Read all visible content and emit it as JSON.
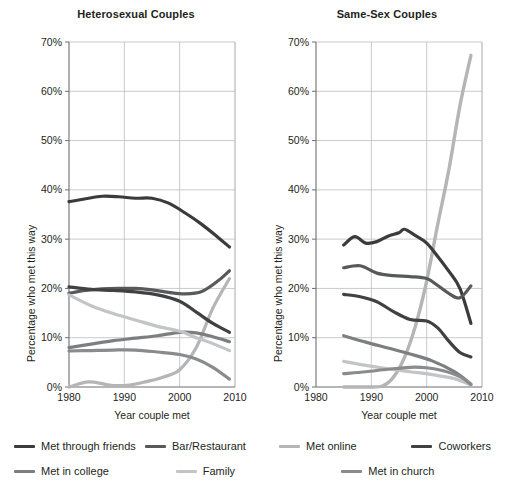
{
  "figure": {
    "xlabel": "Year couple met",
    "ylabel": "Percentage who met this way"
  },
  "legend": {
    "rows": [
      [
        {
          "label": "Met through friends",
          "color": "#3b3b3b",
          "key": "met_through_friends"
        },
        {
          "label": "Bar/Restaurant",
          "color": "#58595b",
          "key": "bar_restaurant"
        },
        {
          "label": "Met online",
          "color": "#b5b5b5",
          "key": "met_online"
        },
        {
          "label": "Coworkers",
          "color": "#414141",
          "key": "coworkers"
        }
      ],
      [
        {
          "label": "Met in college",
          "color": "#7d7e80",
          "key": "met_in_college"
        },
        {
          "label": "Family",
          "color": "#c3c4c6",
          "key": "family"
        },
        {
          "label": "Met in church",
          "color": "#8a8b8d",
          "key": "met_in_church"
        }
      ]
    ]
  },
  "chart_data": [
    {
      "type": "line",
      "title": "Heterosexual Couples",
      "xlabel": "Year couple met",
      "ylabel": "Percentage who met this way",
      "xlim": [
        1980,
        2010
      ],
      "ylim": [
        0,
        70
      ],
      "xticks": [
        1980,
        1990,
        2000,
        2010
      ],
      "yticks": [
        0,
        10,
        20,
        30,
        40,
        50,
        60,
        70
      ],
      "ytick_labels": [
        "0%",
        "10%",
        "20%",
        "30%",
        "40%",
        "50%",
        "60%",
        "70%"
      ],
      "grid": true,
      "legend_position": "below-figure",
      "series": [
        {
          "name": "Met through friends",
          "color": "#3b3b3b",
          "width": 3.2,
          "x": [
            1980,
            1983,
            1986,
            1989,
            1992,
            1995,
            1998,
            2001,
            2004,
            2007,
            2009
          ],
          "values": [
            37.6,
            38.2,
            38.7,
            38.6,
            38.3,
            38.3,
            37.3,
            35.3,
            33.0,
            30.3,
            28.4
          ]
        },
        {
          "name": "Bar/Restaurant",
          "color": "#58595b",
          "width": 3.2,
          "x": [
            1980,
            1983,
            1986,
            1989,
            1992,
            1995,
            1998,
            2001,
            2004,
            2007,
            2009
          ],
          "values": [
            19.0,
            19.6,
            19.9,
            20.0,
            20.0,
            19.7,
            19.2,
            18.9,
            19.4,
            21.6,
            23.6
          ]
        },
        {
          "name": "Met online",
          "color": "#b5b5b5",
          "width": 3.2,
          "x": [
            1980,
            1983,
            1985,
            1988,
            1991,
            1994,
            1997,
            2000,
            2003,
            2006,
            2009
          ],
          "values": [
            0.0,
            1.0,
            0.9,
            0.3,
            0.4,
            1.1,
            2.0,
            3.5,
            8.0,
            16.0,
            22.0
          ]
        },
        {
          "name": "Coworkers",
          "color": "#414141",
          "width": 3.2,
          "x": [
            1980,
            1984,
            1988,
            1992,
            1996,
            2000,
            2003,
            2006,
            2009
          ],
          "values": [
            20.3,
            19.8,
            19.6,
            19.3,
            18.7,
            17.4,
            15.2,
            12.9,
            11.1
          ]
        },
        {
          "name": "Met in college",
          "color": "#7d7e80",
          "width": 3.2,
          "x": [
            1980,
            1984,
            1988,
            1992,
            1996,
            2000,
            2003,
            2006,
            2009
          ],
          "values": [
            8.0,
            8.7,
            9.4,
            9.9,
            10.4,
            11.1,
            11.0,
            10.2,
            9.2
          ]
        },
        {
          "name": "Family",
          "color": "#c3c4c6",
          "width": 3.2,
          "x": [
            1980,
            1984,
            1988,
            1992,
            1996,
            2000,
            2003,
            2006,
            2009
          ],
          "values": [
            18.7,
            16.5,
            14.9,
            13.6,
            12.3,
            11.3,
            10.0,
            8.8,
            7.4
          ]
        },
        {
          "name": "Met in church",
          "color": "#8a8b8d",
          "width": 3.2,
          "x": [
            1980,
            1984,
            1988,
            1992,
            1996,
            2000,
            2003,
            2006,
            2009
          ],
          "values": [
            7.3,
            7.4,
            7.5,
            7.5,
            7.1,
            6.6,
            5.7,
            4.0,
            1.6
          ]
        }
      ]
    },
    {
      "type": "line",
      "title": "Same-Sex Couples",
      "xlabel": "Year couple met",
      "ylabel": "Percentage who met this way",
      "xlim": [
        1980,
        2010
      ],
      "ylim": [
        0,
        70
      ],
      "xticks": [
        1980,
        1990,
        2000,
        2010
      ],
      "yticks": [
        0,
        10,
        20,
        30,
        40,
        50,
        60,
        70
      ],
      "ytick_labels": [
        "0%",
        "10%",
        "20%",
        "30%",
        "40%",
        "50%",
        "60%",
        "70%"
      ],
      "grid": true,
      "legend_position": "below-figure",
      "series": [
        {
          "name": "Met online",
          "color": "#b5b5b5",
          "width": 3.4,
          "x": [
            1985,
            1989,
            1992,
            1994,
            1996,
            1998,
            2000,
            2002,
            2004,
            2006,
            2008
          ],
          "values": [
            0.0,
            0.0,
            0.2,
            2.0,
            6.0,
            12.5,
            21.5,
            33.0,
            44.0,
            57.0,
            67.3
          ]
        },
        {
          "name": "Met through friends",
          "color": "#3b3b3b",
          "width": 3.2,
          "x": [
            1985,
            1987,
            1989,
            1991,
            1993,
            1995,
            1996,
            1998,
            2000,
            2002,
            2004,
            2006,
            2008
          ],
          "values": [
            28.8,
            30.5,
            29.2,
            29.5,
            30.6,
            31.3,
            32.0,
            30.7,
            29.2,
            26.5,
            23.5,
            20.0,
            12.9
          ]
        },
        {
          "name": "Bar/Restaurant",
          "color": "#58595b",
          "width": 3.2,
          "x": [
            1985,
            1988,
            1991,
            1994,
            1997,
            2000,
            2002,
            2004,
            2006,
            2008
          ],
          "values": [
            24.2,
            24.6,
            23.1,
            22.6,
            22.4,
            22.0,
            20.6,
            19.0,
            18.1,
            20.5
          ]
        },
        {
          "name": "Coworkers",
          "color": "#414141",
          "width": 3.2,
          "x": [
            1985,
            1988,
            1991,
            1994,
            1997,
            2000,
            2002,
            2004,
            2006,
            2008
          ],
          "values": [
            18.8,
            18.3,
            17.3,
            15.3,
            13.7,
            13.4,
            12.0,
            9.3,
            7.0,
            6.1
          ]
        },
        {
          "name": "Met in college",
          "color": "#7d7e80",
          "width": 3.2,
          "x": [
            1985,
            1989,
            1993,
            1997,
            2001,
            2005,
            2008
          ],
          "values": [
            10.4,
            9.1,
            7.9,
            6.7,
            5.3,
            3.1,
            0.6
          ]
        },
        {
          "name": "Family",
          "color": "#c3c4c6",
          "width": 3.2,
          "x": [
            1985,
            1989,
            1993,
            1997,
            2001,
            2005,
            2008
          ],
          "values": [
            5.2,
            4.4,
            3.7,
            3.1,
            2.5,
            1.7,
            0.4
          ]
        },
        {
          "name": "Met in church",
          "color": "#8a8b8d",
          "width": 3.2,
          "x": [
            1985,
            1989,
            1993,
            1997,
            2000,
            2003,
            2006,
            2008
          ],
          "values": [
            2.7,
            3.1,
            3.6,
            4.0,
            3.9,
            3.3,
            2.1,
            0.5
          ]
        }
      ]
    }
  ]
}
